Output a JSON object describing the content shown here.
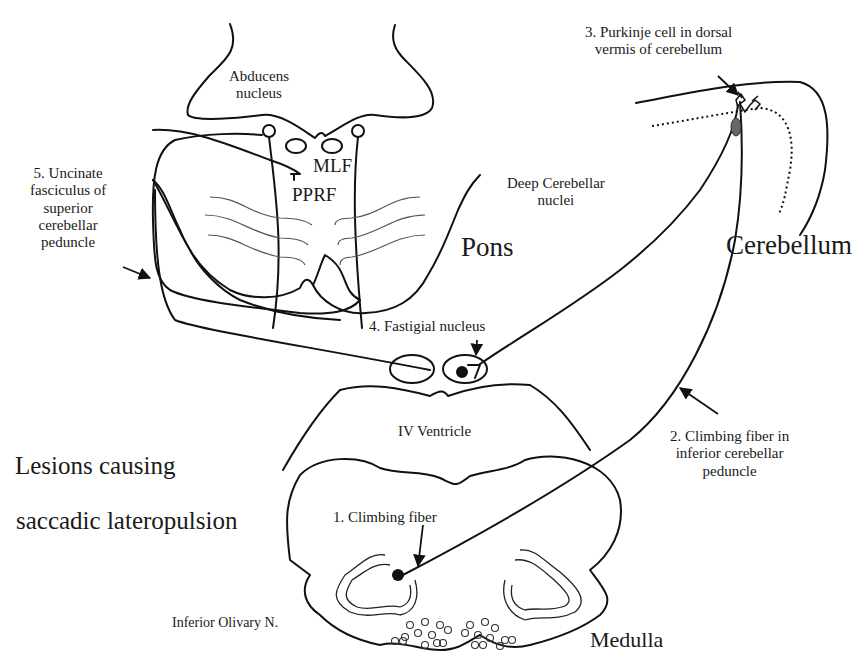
{
  "diagram": {
    "title_line1": "Lesions causing",
    "title_line2": "saccadic lateropulsion",
    "regions": {
      "pons": "Pons",
      "cerebellum": "Cerebellum",
      "medulla": "Medulla"
    },
    "structures": {
      "abducens_line1": "Abducens",
      "abducens_line2": "nucleus",
      "mlf": "MLF",
      "pprf": "PPRF",
      "deep_cerebellar_line1": "Deep Cerebellar",
      "deep_cerebellar_line2": "nuclei",
      "iv_ventricle": "IV Ventricle",
      "inferior_olivary": "Inferior Olivary N."
    },
    "lesions": [
      {
        "number": 1,
        "lines": [
          "1. Climbing fiber"
        ]
      },
      {
        "number": 2,
        "lines": [
          "2. Climbing fiber in",
          "inferior cerebellar",
          "peduncle"
        ]
      },
      {
        "number": 3,
        "lines": [
          "3. Purkinje cell in dorsal",
          "vermis of cerebellum"
        ]
      },
      {
        "number": 4,
        "lines": [
          "4. Fastigial nucleus"
        ]
      },
      {
        "number": 5,
        "lines": [
          "5. Uncinate",
          "fasciculus of",
          "superior",
          "cerebellar",
          "peduncle"
        ]
      }
    ],
    "colors": {
      "stroke": "#111111",
      "thin_stroke": "#444444",
      "purkinje_soma": "#666666",
      "background": "#ffffff"
    }
  }
}
